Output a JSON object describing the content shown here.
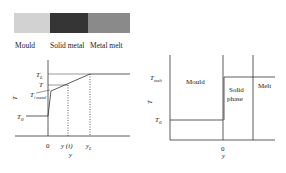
{
  "legend": {
    "items": [
      {
        "label": "Mould",
        "color": "#d2d2d2"
      },
      {
        "label": "Solid metal",
        "color": "#353535"
      },
      {
        "label": "Metal melt",
        "color": "#8a8a8a"
      }
    ]
  },
  "left_plot": {
    "y_axis_label": "T",
    "x_axis_label": "y",
    "labels": {
      "T_L": "T",
      "T_L_sub": "L",
      "T": "T",
      "T_i_metal": "T",
      "T_i_metal_sub": "i metal",
      "T_0": "T",
      "T_0_sub": "0",
      "x0": "0",
      "y_t": "y (t)",
      "y_L": "y",
      "y_L_sub": "L"
    }
  },
  "right_plot": {
    "y_axis_label": "T",
    "x_axis_label": "y",
    "labels": {
      "T_melt": "T",
      "T_melt_sub": "melt",
      "T_0": "T",
      "T_0_sub": "0",
      "x0": "0"
    },
    "regions": {
      "mould": "Mould",
      "solid_1": "Solid",
      "solid_2": "phase",
      "melt": "Melt"
    }
  }
}
